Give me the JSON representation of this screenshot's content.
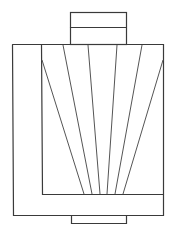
{
  "diagram": {
    "stroke_color": "#333333",
    "background": "#ffffff"
  }
}
